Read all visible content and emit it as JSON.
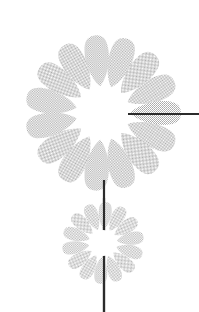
{
  "canvas": {
    "width": 199,
    "height": 312,
    "background_color": "#ffffff",
    "title": "Daisy flower line illustration with leader line"
  },
  "palette": {
    "petal_fill": "#c9c9c9",
    "petal_fill_light": "#d6d6d6",
    "disc_fill": "#ffffff",
    "line_dark": "#2b2b2b",
    "background": "#ffffff"
  },
  "figure": {
    "name": "daisy-diagram",
    "texture": "halftone-dither"
  },
  "elements": {
    "large_flower": {
      "name": "large-daisy",
      "center_x": 103,
      "center_y": 113,
      "petal_count": 15,
      "petal_outer_radius": 78,
      "petal_inner_radius": 27,
      "petal_half_width": 13,
      "disc_radius": 26,
      "rotation_offset_deg": -6,
      "fill": "#c9c9c9",
      "disc_fill": "#ffffff"
    },
    "small_flower": {
      "name": "small-daisy",
      "center_x": 103,
      "center_y": 243,
      "petal_count": 14,
      "petal_outer_radius": 41,
      "petal_inner_radius": 14,
      "petal_half_width": 7,
      "disc_radius": 13,
      "rotation_offset_deg": 4,
      "fill": "#cccccc",
      "disc_fill": "#ffffff"
    },
    "stem": {
      "name": "flower-stem",
      "x": 104,
      "y_top": 180,
      "y_bottom": 312,
      "width": 2.2,
      "color": "#2b2b2b"
    },
    "leader_line": {
      "name": "callout-leader-line",
      "x_start": 128,
      "x_end": 199,
      "y": 114,
      "thickness": 2,
      "color": "#2b2b2b"
    }
  }
}
